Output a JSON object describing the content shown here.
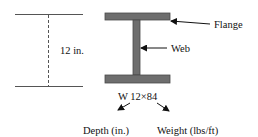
{
  "labels": {
    "depth_dimension": "12 in.",
    "flange": "Flange",
    "web": "Web",
    "designation": "W 12×84",
    "depth_caption": "Depth (in.)",
    "weight_caption": "Weight (lbs/ft)"
  },
  "colors": {
    "beam_fill": "#6e6e6e",
    "beam_stroke": "#4a4a4a",
    "line": "#555555",
    "text": "#111111"
  }
}
